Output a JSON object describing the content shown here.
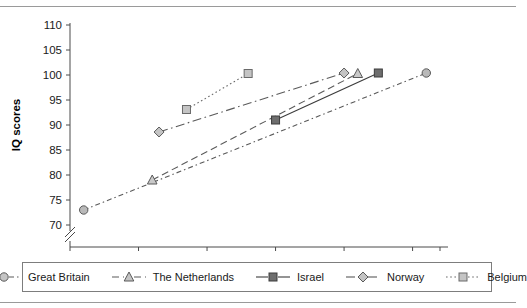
{
  "chart_data": {
    "type": "line",
    "title": "",
    "xlabel": "",
    "ylabel": "IQ scores",
    "xlim": [
      1940,
      1994
    ],
    "ylim": [
      70,
      110
    ],
    "xticks": [
      1940,
      1950,
      1960,
      1970,
      1980,
      1990,
      1994
    ],
    "yticks": [
      70,
      75,
      80,
      85,
      90,
      95,
      100,
      105,
      110
    ],
    "grid": false,
    "y_axis_break": true,
    "legend_position": "bottom",
    "series": [
      {
        "name": "Great Britain",
        "marker": "circle",
        "marker_fill": "#b9b9b9",
        "line_style": "dash-dot-fine",
        "color": "#5a5a5a",
        "points": [
          {
            "x": 1942,
            "y": 73.0
          },
          {
            "x": 1992,
            "y": 100.4
          }
        ]
      },
      {
        "name": "The Netherlands",
        "marker": "triangle",
        "marker_fill": "#c9c9c9",
        "line_style": "dashed",
        "color": "#5a5a5a",
        "points": [
          {
            "x": 1952,
            "y": 79.0
          },
          {
            "x": 1982,
            "y": 100.3
          }
        ]
      },
      {
        "name": "Israel",
        "marker": "square",
        "marker_fill": "#6e6e6e",
        "line_style": "solid",
        "color": "#3c3c3c",
        "points": [
          {
            "x": 1970,
            "y": 91.0
          },
          {
            "x": 1985,
            "y": 100.4
          }
        ]
      },
      {
        "name": "Norway",
        "marker": "diamond",
        "marker_fill": "#c4c4c4",
        "line_style": "dash-dot",
        "color": "#5a5a5a",
        "points": [
          {
            "x": 1953,
            "y": 88.6
          },
          {
            "x": 1980,
            "y": 100.4
          }
        ]
      },
      {
        "name": "Belgium",
        "marker": "square",
        "marker_fill": "#c4c4c4",
        "line_style": "dotted",
        "color": "#6a6a6a",
        "points": [
          {
            "x": 1957,
            "y": 93.1
          },
          {
            "x": 1966,
            "y": 100.3
          }
        ]
      }
    ]
  },
  "legend": {
    "items": [
      {
        "label": "Great Britain",
        "marker": "circle",
        "style": "dash-dot-fine"
      },
      {
        "label": "The Netherlands",
        "marker": "triangle",
        "style": "dashed"
      },
      {
        "label": "Israel",
        "marker": "square-dark",
        "style": "solid"
      },
      {
        "label": "Norway",
        "marker": "diamond",
        "style": "dash-dot"
      },
      {
        "label": "Belgium",
        "marker": "square-light",
        "style": "dotted"
      }
    ]
  },
  "colors": {
    "axis": "#4a4a4a",
    "text": "#1a1a1a",
    "rule": "#9a9a9a",
    "legend_border": "#7d7d7d"
  }
}
